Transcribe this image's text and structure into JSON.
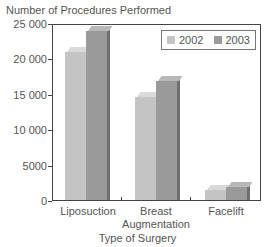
{
  "chart_data": {
    "type": "bar",
    "title": "",
    "ylabel": "Number of Procedures Performed",
    "xlabel": "Type of Surgery",
    "categories": [
      "Liposuction",
      "Breast Augmentation",
      "Facelift"
    ],
    "category_labels_display": [
      [
        "Liposuction"
      ],
      [
        "Breast",
        "Augmentation"
      ],
      [
        "Facelift"
      ]
    ],
    "series": [
      {
        "name": "2002",
        "values": [
          21000,
          14700,
          1500
        ],
        "color": "#c4c4c4"
      },
      {
        "name": "2003",
        "values": [
          24000,
          17000,
          2000
        ],
        "color": "#9a9a9a"
      }
    ],
    "ylim": [
      0,
      25000
    ],
    "yticks": [
      0,
      5000,
      10000,
      15000,
      20000,
      25000
    ],
    "ytick_labels": [
      "0",
      "5000",
      "10 000",
      "15 000",
      "20 000",
      "25 000"
    ],
    "grid": false,
    "legend_position": "upper right",
    "style": "3d"
  },
  "legend": {
    "items": [
      {
        "label": "2002",
        "color": "#c4c4c4"
      },
      {
        "label": "2003",
        "color": "#9a9a9a"
      }
    ]
  }
}
